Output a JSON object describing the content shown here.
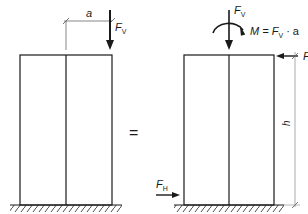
{
  "figure": {
    "left_frame": {
      "dimension_label": "a",
      "force_label": "F",
      "force_sub": "V"
    },
    "equals_sign": "=",
    "right_frame": {
      "vertical_force_label": "F",
      "vertical_force_sub": "V",
      "moment_label": "M = F",
      "moment_sub": "V",
      "moment_tail": " · a",
      "top_horizontal_force_label": "F",
      "bottom_horizontal_force_label": "F",
      "bottom_horizontal_force_sub": "H",
      "height_label": "h"
    },
    "colors": {
      "line": "#1a1a1a",
      "dim_line": "#555555"
    }
  }
}
